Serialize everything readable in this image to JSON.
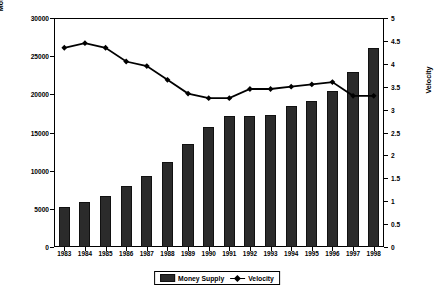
{
  "chart_data": {
    "type": "bar",
    "title": "",
    "subtitle": "",
    "xlabel": "",
    "ylabel": "Money supply in billions of marks",
    "y2label": "Velocity",
    "grid": false,
    "legend_position": "bottom",
    "categories": [
      "1983",
      "1984",
      "1985",
      "1986",
      "1987",
      "1988",
      "1989",
      "1990",
      "1991",
      "1992",
      "1993",
      "1994",
      "1995",
      "1996",
      "1997",
      "1998"
    ],
    "ylim": [
      0,
      30000
    ],
    "y_ticks": [
      0,
      5000,
      10000,
      15000,
      20000,
      25000,
      30000
    ],
    "y_tick_labels": [
      "0",
      "5000",
      "10000",
      "15000",
      "20000",
      "25000",
      "30000"
    ],
    "y2lim": [
      0,
      5
    ],
    "y2_ticks": [
      0,
      0.5,
      1,
      1.5,
      2,
      2.5,
      3,
      3.5,
      4,
      4.5,
      5
    ],
    "y2_tick_labels": [
      "0",
      "0.5",
      "1",
      "1.5",
      "2",
      "2.5",
      "3",
      "3.5",
      "4",
      "4.5",
      "5"
    ],
    "series": [
      {
        "name": "Money Supply",
        "type": "bar",
        "axis": "left",
        "color": "#2b2b2b",
        "values": [
          5300,
          5900,
          6700,
          8000,
          9300,
          11200,
          13500,
          15700,
          17200,
          17100,
          17300,
          18500,
          19100,
          20400,
          22900,
          26100
        ]
      },
      {
        "name": "Velocity",
        "type": "line",
        "axis": "right",
        "color": "#000000",
        "marker": "diamond",
        "values": [
          4.35,
          4.45,
          4.35,
          4.05,
          3.95,
          3.65,
          3.35,
          3.25,
          3.25,
          3.45,
          3.45,
          3.5,
          3.55,
          3.6,
          3.3,
          3.3
        ]
      }
    ]
  },
  "legend": {
    "items": [
      {
        "label": "Money Supply",
        "marker": "bar-swatch"
      },
      {
        "label": "Velocity",
        "marker": "line-diamond"
      }
    ]
  },
  "axes": {
    "left_title": "Money supply in billions of marks",
    "right_title": "Velocity"
  }
}
